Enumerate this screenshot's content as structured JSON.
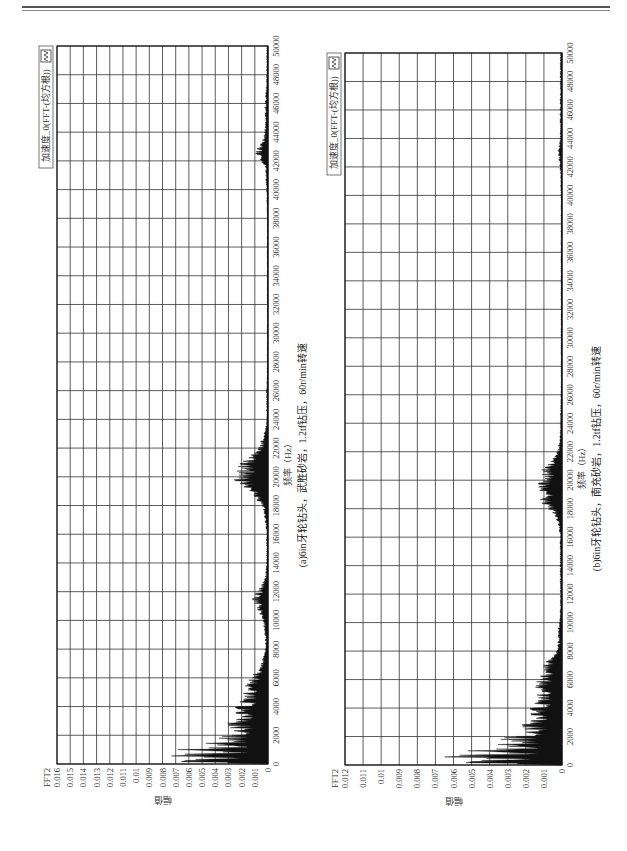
{
  "page": {
    "header_text": "",
    "accent_color": "#111111"
  },
  "chart_data": [
    {
      "id": "a",
      "type": "area",
      "title": "",
      "caption": "(a)6in牙轮钻头，武胜砂岩，1.2tf钻压，60r/min转速",
      "xlabel": "频率（Hz）",
      "ylabel": "幅值",
      "y_unit_label": "FFT2",
      "legend": [
        "加速度_0(FFT-(均方根))"
      ],
      "legend_position": "top-right",
      "grid": true,
      "xlim": [
        0,
        50000
      ],
      "ylim": [
        0,
        0.016
      ],
      "x_ticks": [
        0,
        2000,
        4000,
        6000,
        8000,
        10000,
        12000,
        14000,
        16000,
        18000,
        20000,
        22000,
        24000,
        26000,
        28000,
        30000,
        32000,
        34000,
        36000,
        38000,
        40000,
        42000,
        44000,
        46000,
        48000,
        50000
      ],
      "y_ticks": [
        "0",
        "0.001",
        "0.002",
        "0.003",
        "0.004",
        "0.005",
        "0.006",
        "0.007",
        "0.008",
        "0.009",
        "0.01",
        "0.011",
        "0.012",
        "0.013",
        "0.014",
        "0.015",
        "0.016"
      ],
      "series": [
        {
          "name": "加速度_0(FFT-(均方根))",
          "x": [
            0,
            200,
            400,
            600,
            800,
            1000,
            1200,
            1400,
            1600,
            1800,
            2000,
            2400,
            2800,
            3200,
            3600,
            4000,
            4400,
            4800,
            5200,
            5600,
            6000,
            6400,
            6800,
            7200,
            7600,
            8000,
            8800,
            9600,
            10400,
            11000,
            11400,
            11800,
            12200,
            12600,
            13000,
            14000,
            15000,
            16000,
            17000,
            18000,
            18600,
            19000,
            19400,
            19800,
            20200,
            20600,
            21000,
            21400,
            22000,
            22600,
            23200,
            24000,
            26000,
            28000,
            30000,
            32000,
            34000,
            36000,
            38000,
            40000,
            41600,
            42200,
            42600,
            43000,
            43600,
            44400,
            46000,
            48000,
            50000
          ],
          "values": [
            0.0003,
            0.0072,
            0.0038,
            0.0068,
            0.0031,
            0.0059,
            0.0025,
            0.0045,
            0.0021,
            0.0034,
            0.0026,
            0.0022,
            0.0029,
            0.0018,
            0.0024,
            0.0021,
            0.0017,
            0.0019,
            0.0015,
            0.0014,
            0.0012,
            0.0008,
            0.0006,
            0.0004,
            0.0003,
            0.0002,
            0.0002,
            0.0003,
            0.0005,
            0.0008,
            0.0011,
            0.0009,
            0.0006,
            0.0004,
            0.0002,
            0.0001,
            0.0001,
            0.0001,
            0.0002,
            0.0004,
            0.0009,
            0.0014,
            0.0019,
            0.0024,
            0.0022,
            0.0021,
            0.0017,
            0.0012,
            0.0007,
            0.0004,
            0.0002,
            0.0001,
            0.0001,
            5e-05,
            5e-05,
            5e-05,
            5e-05,
            5e-05,
            5e-05,
            0.0001,
            0.0002,
            0.0006,
            0.0009,
            0.0006,
            0.0003,
            0.0002,
            0.0002,
            0.0001,
            0.0001
          ]
        }
      ]
    },
    {
      "id": "b",
      "type": "area",
      "title": "",
      "caption": "(b)6in牙轮钻头，南充砂岩，1.2tf钻压，60r/min转速",
      "xlabel": "频率（Hz）",
      "ylabel": "幅值",
      "y_unit_label": "FFT2",
      "legend": [
        "加速度_0(FFT-(均方根))"
      ],
      "legend_position": "top-right",
      "grid": true,
      "xlim": [
        0,
        50000
      ],
      "ylim": [
        0,
        0.012
      ],
      "x_ticks": [
        0,
        2000,
        4000,
        6000,
        8000,
        10000,
        12000,
        14000,
        16000,
        18000,
        20000,
        22000,
        24000,
        26000,
        28000,
        30000,
        32000,
        34000,
        36000,
        38000,
        40000,
        42000,
        44000,
        46000,
        48000,
        50000
      ],
      "y_ticks": [
        "0",
        "0.001",
        "0.002",
        "0.003",
        "0.004",
        "0.005",
        "0.006",
        "0.007",
        "0.008",
        "0.009",
        "0.01",
        "0.011",
        "0.012"
      ],
      "series": [
        {
          "name": "加速度_0(FFT-(均方根))",
          "x": [
            0,
            200,
            400,
            600,
            800,
            1000,
            1200,
            1400,
            1600,
            1800,
            2000,
            2400,
            2800,
            3200,
            3600,
            4000,
            4400,
            4800,
            5200,
            5600,
            6000,
            6400,
            6800,
            7200,
            7600,
            8000,
            8800,
            9600,
            10400,
            11000,
            11600,
            12400,
            13200,
            14000,
            15000,
            16000,
            17000,
            17600,
            18200,
            18600,
            19000,
            19400,
            19800,
            20200,
            20600,
            21000,
            21600,
            22200,
            23000,
            24000,
            26000,
            28000,
            30000,
            32000,
            34000,
            36000,
            38000,
            40000,
            42000,
            43000,
            44000,
            46000,
            48000,
            50000
          ],
          "values": [
            0.0003,
            0.0058,
            0.0031,
            0.0061,
            0.0028,
            0.0045,
            0.0022,
            0.0033,
            0.0019,
            0.0031,
            0.0024,
            0.0016,
            0.0021,
            0.0013,
            0.0017,
            0.0015,
            0.0012,
            0.0014,
            0.0011,
            0.0013,
            0.0012,
            0.0009,
            0.0011,
            0.0008,
            0.0005,
            0.0003,
            0.0002,
            0.0002,
            0.0001,
            0.0001,
            0.0001,
            0.0001,
            0.0001,
            0.0001,
            0.0001,
            0.0001,
            0.0002,
            0.0004,
            0.0008,
            0.0011,
            0.0009,
            0.0013,
            0.0012,
            0.0009,
            0.0011,
            0.0007,
            0.0004,
            0.0002,
            0.0001,
            0.0001,
            5e-05,
            5e-05,
            5e-05,
            5e-05,
            5e-05,
            5e-05,
            5e-05,
            5e-05,
            0.0001,
            0.0002,
            0.0001,
            0.0001,
            0.0001,
            0.0001
          ]
        }
      ]
    }
  ]
}
